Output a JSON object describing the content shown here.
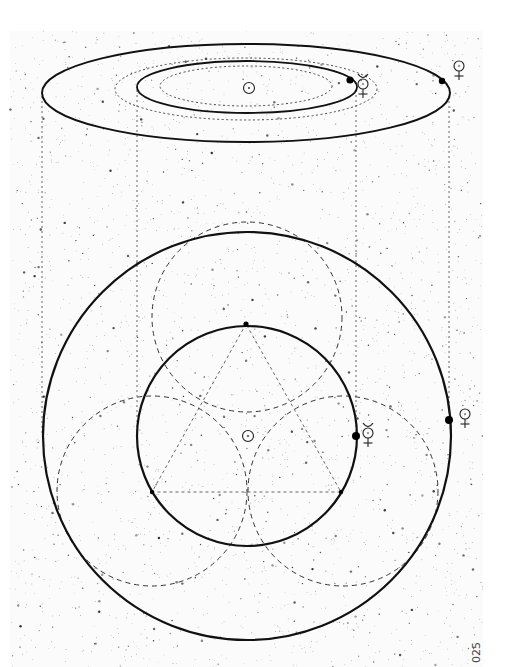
{
  "figure": {
    "page_number": "025",
    "colors": {
      "ink": "#111111",
      "background": "#ffffff",
      "stars": "#222222"
    }
  },
  "oblique_view": {
    "sun": {
      "symbol": "sun-symbol",
      "x": 249,
      "y": 88
    },
    "orbits": [
      {
        "name": "venus-orbit",
        "style": "solid",
        "cx": 246,
        "cy": 93,
        "rx": 204,
        "ry": 49,
        "stroke_width": 2
      },
      {
        "name": "venus-orbit-inner-guide",
        "style": "dashed",
        "cx": 246,
        "cy": 89,
        "rx": 131,
        "ry": 31
      },
      {
        "name": "mercury-orbit",
        "style": "solid",
        "cx": 247,
        "cy": 87,
        "rx": 110,
        "ry": 26,
        "stroke_width": 1.8
      },
      {
        "name": "mercury-orbit-inner-guide",
        "style": "dashed",
        "cx": 246,
        "cy": 86,
        "rx": 86,
        "ry": 20
      }
    ],
    "planets": [
      {
        "name": "mercury",
        "dot": {
          "x": 350,
          "y": 80,
          "r": 3.6
        },
        "symbol_pos": {
          "x": 363,
          "y": 84
        }
      },
      {
        "name": "venus",
        "dot": {
          "x": 442,
          "y": 81,
          "r": 3.2
        },
        "symbol_pos": {
          "x": 459,
          "y": 66
        }
      }
    ]
  },
  "projection_lines": [
    {
      "x": 42,
      "y1": 96,
      "y2": 436
    },
    {
      "x": 137,
      "y1": 90,
      "y2": 436
    },
    {
      "x": 356,
      "y1": 90,
      "y2": 436
    },
    {
      "x": 449,
      "y1": 96,
      "y2": 420
    }
  ],
  "top_view": {
    "sun": {
      "symbol": "sun-symbol",
      "x": 248,
      "y": 436
    },
    "orbits": [
      {
        "name": "venus-orbit",
        "cx": 247,
        "cy": 436,
        "r": 204,
        "stroke_width": 2.2
      },
      {
        "name": "mercury-orbit",
        "cx": 247,
        "cy": 436,
        "r": 110,
        "stroke_width": 2.2
      }
    ],
    "construction_circles": [
      {
        "name": "construction-circle-top",
        "cx": 247,
        "cy": 317,
        "r": 95
      },
      {
        "name": "construction-circle-bottom-left",
        "cx": 152,
        "cy": 491,
        "r": 95
      },
      {
        "name": "construction-circle-bottom-right",
        "cx": 343,
        "cy": 491,
        "r": 95
      }
    ],
    "triangle": [
      [
        246,
        324
      ],
      [
        152,
        492
      ],
      [
        341,
        492
      ]
    ],
    "vertex_dots": [
      {
        "x": 246,
        "y": 324,
        "r": 2.6
      },
      {
        "x": 152,
        "y": 492,
        "r": 2.2
      },
      {
        "x": 341,
        "y": 492,
        "r": 2.2
      }
    ],
    "planets": [
      {
        "name": "mercury",
        "dot": {
          "x": 356,
          "y": 436,
          "r": 4
        },
        "symbol_pos": {
          "x": 368,
          "y": 433
        }
      },
      {
        "name": "venus",
        "dot": {
          "x": 449,
          "y": 420,
          "r": 4
        },
        "symbol_pos": {
          "x": 465,
          "y": 414
        }
      }
    ]
  }
}
